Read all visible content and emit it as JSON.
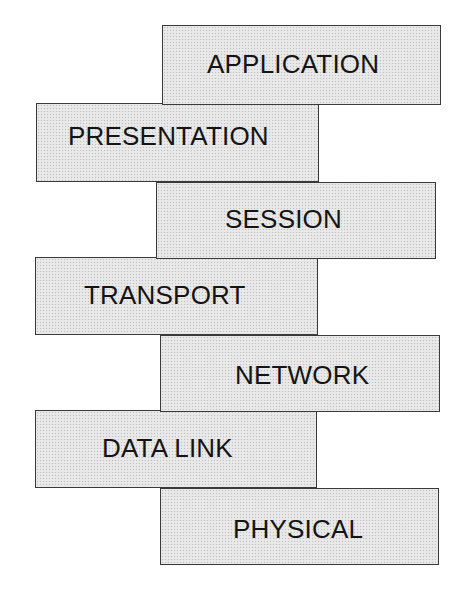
{
  "diagram": {
    "title": "",
    "layers": [
      {
        "label": "APPLICATION",
        "order": 7
      },
      {
        "label": "PRESENTATION",
        "order": 6
      },
      {
        "label": "SESSION",
        "order": 5
      },
      {
        "label": "TRANSPORT",
        "order": 4
      },
      {
        "label": "NETWORK",
        "order": 3
      },
      {
        "label": "DATA LINK",
        "order": 2
      },
      {
        "label": "PHYSICAL",
        "order": 1
      }
    ],
    "colors": {
      "box_fill": "#e6e6e6",
      "box_border": "#3a3a3a",
      "text": "#141414",
      "background": "#ffffff"
    }
  }
}
